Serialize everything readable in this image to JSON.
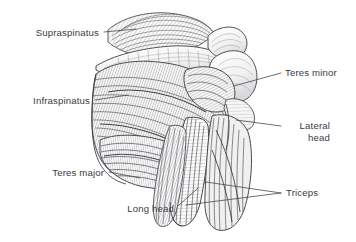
{
  "figure": {
    "background_color": "#ffffff",
    "ink_color": "#3b3b3f",
    "leader_color": "#4a4a4f",
    "width": 356,
    "height": 242
  },
  "labels": {
    "supraspinatus": "Supraspinatus",
    "infraspinatus": "Infraspinatus",
    "teres_major": "Teres major",
    "long_head": "Long head",
    "teres_minor": "Teres minor",
    "lateral_head_line1": "Lateral",
    "lateral_head_line2": "head",
    "triceps": "Triceps"
  },
  "annotations": [
    {
      "id": "supraspinatus",
      "label": "Supraspinatus",
      "side": "left",
      "text_x": 99,
      "text_y": 36,
      "leader_from_x": 104,
      "leader_from_y": 32,
      "leader_to_x": 136,
      "leader_to_y": 29
    },
    {
      "id": "infraspinatus",
      "label": "Infraspinatus",
      "side": "left",
      "text_x": 90,
      "text_y": 104,
      "leader_from_x": 95,
      "leader_from_y": 100,
      "leader_to_x": 126,
      "leader_to_y": 96
    },
    {
      "id": "teres-major",
      "label": "Teres major",
      "side": "left",
      "text_x": 104,
      "text_y": 176,
      "leader_from_x": 109,
      "leader_from_y": 172,
      "leader_to_x": 140,
      "leader_to_y": 178
    },
    {
      "id": "long-head",
      "label": "Long head",
      "side": "left",
      "text_x": 174,
      "text_y": 212,
      "leader_from_x": 178,
      "leader_from_y": 206,
      "leader_to_x": 196,
      "leader_to_y": 190
    },
    {
      "id": "teres-minor",
      "label": "Teres minor",
      "side": "right",
      "text_x": 285,
      "text_y": 76,
      "leader_from_x": 281,
      "leader_from_y": 73,
      "leader_to_x": 234,
      "leader_to_y": 86
    },
    {
      "id": "lateral-head",
      "label": "Lateral head",
      "side": "right",
      "text_x": 286,
      "text_y": 129,
      "leader_from_x": 281,
      "leader_from_y": 126,
      "leader_to_x": 238,
      "leader_to_y": 121
    },
    {
      "id": "triceps",
      "label": "Triceps",
      "side": "right",
      "text_x": 286,
      "text_y": 196,
      "leader_from_x": 281,
      "leader_from_y": 193,
      "leader_to_x": 225,
      "leader_to_y": 186
    }
  ],
  "illustration": {
    "type": "line-drawing",
    "subject": "posterior view of right shoulder and upper arm",
    "style": "pen-and-ink cross-hatching, greyscale",
    "structures": [
      "supraspinatus muscle",
      "scapular spine",
      "acromion",
      "infraspinatus muscle",
      "teres minor muscle",
      "teres major muscle",
      "deltoid insertion",
      "triceps long head",
      "triceps lateral head",
      "humerus"
    ]
  }
}
